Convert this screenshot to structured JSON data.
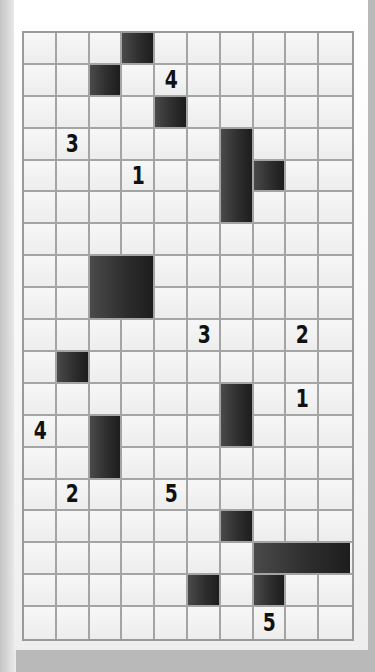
{
  "puzzle": {
    "type": "nurikabe-style grid",
    "columns": 10,
    "rows": 19,
    "clues": [
      {
        "row": 1,
        "col": 4,
        "value": "4"
      },
      {
        "row": 3,
        "col": 1,
        "value": "3"
      },
      {
        "row": 4,
        "col": 3,
        "value": "1"
      },
      {
        "row": 9,
        "col": 5,
        "value": "3"
      },
      {
        "row": 9,
        "col": 8,
        "value": "2"
      },
      {
        "row": 11,
        "col": 8,
        "value": "1"
      },
      {
        "row": 12,
        "col": 0,
        "value": "4"
      },
      {
        "row": 14,
        "col": 1,
        "value": "2"
      },
      {
        "row": 14,
        "col": 4,
        "value": "5"
      },
      {
        "row": 18,
        "col": 7,
        "value": "5"
      }
    ],
    "shaded_cells": [
      [
        0,
        3
      ],
      [
        1,
        2
      ],
      [
        2,
        4
      ],
      [
        3,
        6
      ],
      [
        4,
        6
      ],
      [
        4,
        7
      ],
      [
        5,
        6
      ],
      [
        7,
        2
      ],
      [
        7,
        3
      ],
      [
        8,
        2
      ],
      [
        8,
        3
      ],
      [
        10,
        1
      ],
      [
        11,
        6
      ],
      [
        12,
        6
      ],
      [
        12,
        2
      ],
      [
        13,
        2
      ],
      [
        15,
        6
      ],
      [
        16,
        7
      ],
      [
        16,
        8
      ],
      [
        16,
        9
      ],
      [
        17,
        7
      ],
      [
        17,
        5
      ]
    ],
    "shaded_blocks": [
      {
        "row": 0,
        "col": 3,
        "h": 1,
        "w": 1
      },
      {
        "row": 1,
        "col": 2,
        "h": 1,
        "w": 1
      },
      {
        "row": 2,
        "col": 4,
        "h": 1,
        "w": 1
      },
      {
        "row": 3,
        "col": 6,
        "h": 3,
        "w": 1
      },
      {
        "row": 4,
        "col": 7,
        "h": 1,
        "w": 1
      },
      {
        "row": 7,
        "col": 2,
        "h": 2,
        "w": 2
      },
      {
        "row": 10,
        "col": 1,
        "h": 1,
        "w": 1
      },
      {
        "row": 11,
        "col": 6,
        "h": 2,
        "w": 1
      },
      {
        "row": 12,
        "col": 2,
        "h": 2,
        "w": 1
      },
      {
        "row": 15,
        "col": 6,
        "h": 1,
        "w": 1
      },
      {
        "row": 16,
        "col": 7,
        "h": 1,
        "w": 3
      },
      {
        "row": 17,
        "col": 7,
        "h": 1,
        "w": 1
      },
      {
        "row": 17,
        "col": 5,
        "h": 1,
        "w": 1
      }
    ],
    "colors": {
      "shade": "#2e2e2e",
      "grid_line": "#a4a4a4",
      "cell": "#f4f4f4",
      "clue_text": "#111111"
    }
  }
}
